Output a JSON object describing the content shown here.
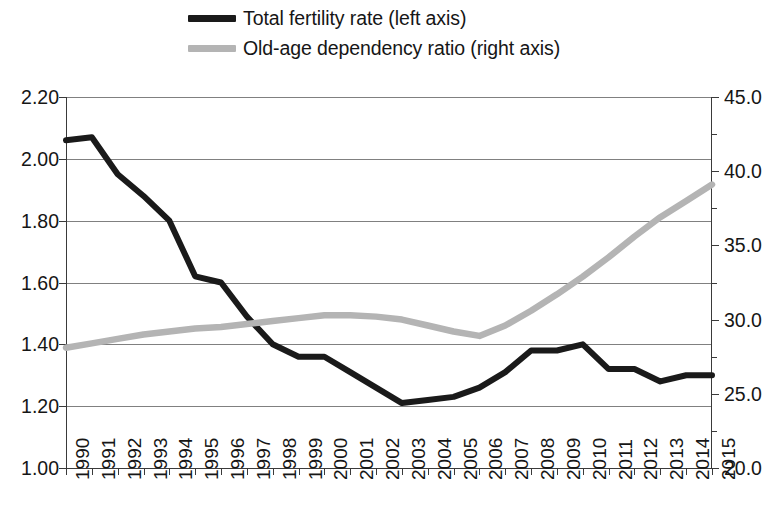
{
  "legend": {
    "entries": [
      {
        "label": "Total fertility rate (left axis)",
        "color": "#1a1a1a",
        "series": "total_fertility_rate"
      },
      {
        "label": "Old-age dependency ratio (right axis)",
        "color": "#b4b4b4",
        "series": "old_age_dependency_ratio"
      }
    ]
  },
  "axes": {
    "left": {
      "ticks": [
        "2.20",
        "2.00",
        "1.80",
        "1.60",
        "1.40",
        "1.20",
        "1.00"
      ],
      "min": 1.0,
      "max": 2.2,
      "step": 0.2
    },
    "right": {
      "ticks": [
        "45.0",
        "40.0",
        "35.0",
        "30.0",
        "25.0",
        "20.0"
      ],
      "min": 20.0,
      "max": 45.0,
      "step": 5.0
    },
    "x": {
      "ticks": [
        "1990",
        "1991",
        "1992",
        "1993",
        "1994",
        "1995",
        "1996",
        "1997",
        "1998",
        "1999",
        "2000",
        "2001",
        "2002",
        "2003",
        "2004",
        "2005",
        "2006",
        "2007",
        "2008",
        "2009",
        "2010",
        "2011",
        "2012",
        "2013",
        "2014",
        "2015"
      ]
    }
  },
  "chart_data": {
    "type": "line",
    "title": "",
    "xlabel": "",
    "ylabel": "",
    "x": [
      1990,
      1991,
      1992,
      1993,
      1994,
      1995,
      1996,
      1997,
      1998,
      1999,
      2000,
      2001,
      2002,
      2003,
      2004,
      2005,
      2006,
      2007,
      2008,
      2009,
      2010,
      2011,
      2012,
      2013,
      2014,
      2015
    ],
    "series": [
      {
        "name": "Total fertility rate (left axis)",
        "axis": "left",
        "color": "#1a1a1a",
        "ylim": [
          1.0,
          2.2
        ],
        "values": [
          2.06,
          2.07,
          1.95,
          1.88,
          1.8,
          1.62,
          1.6,
          1.49,
          1.4,
          1.36,
          1.36,
          1.31,
          1.26,
          1.21,
          1.22,
          1.23,
          1.26,
          1.31,
          1.38,
          1.38,
          1.4,
          1.32,
          1.32,
          1.28,
          1.3,
          1.3
        ]
      },
      {
        "name": "Old-age dependency ratio (right axis)",
        "axis": "right",
        "color": "#b4b4b4",
        "ylim": [
          20.0,
          45.0
        ],
        "values": [
          28.1,
          28.4,
          28.7,
          29.0,
          29.2,
          29.4,
          29.5,
          29.7,
          29.9,
          30.1,
          30.3,
          30.3,
          30.2,
          30.0,
          29.6,
          29.2,
          28.9,
          29.6,
          30.6,
          31.7,
          32.9,
          34.2,
          35.6,
          36.9,
          38.0,
          39.1
        ]
      }
    ],
    "grid": true,
    "legend_position": "top"
  },
  "geometry": {
    "plot_left": 66,
    "plot_right": 712,
    "plot_top": 97,
    "plot_bottom": 468
  }
}
